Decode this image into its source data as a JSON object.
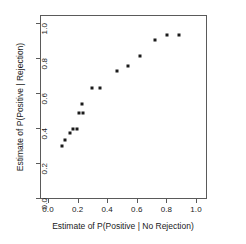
{
  "chart_data": {
    "type": "scatter",
    "title": "",
    "xlabel": "Estimate of P(Positive | No Rejection)",
    "ylabel": "Estimate of P(Positive | Rejection)",
    "xlim": [
      0.0,
      1.0
    ],
    "ylim": [
      0.0,
      1.0
    ],
    "xticks": [
      "0.0",
      "0.2",
      "0.4",
      "0.6",
      "0.8",
      "1.0"
    ],
    "xtick_values": [
      0.0,
      0.2,
      0.4,
      0.6,
      0.8,
      1.0
    ],
    "yticks": [
      "0.0",
      "0.2",
      "0.4",
      "0.6",
      "0.8",
      "1.0"
    ],
    "ytick_values": [
      0.0,
      0.2,
      0.4,
      0.6,
      0.8,
      1.0
    ],
    "grid": false,
    "legend": null,
    "marker": "filled-square",
    "marker_color": "#1b1b1b",
    "points": [
      {
        "x": 0.09,
        "y": 0.305
      },
      {
        "x": 0.105,
        "y": 0.335
      },
      {
        "x": 0.145,
        "y": 0.375
      },
      {
        "x": 0.165,
        "y": 0.4
      },
      {
        "x": 0.19,
        "y": 0.4
      },
      {
        "x": 0.205,
        "y": 0.49
      },
      {
        "x": 0.23,
        "y": 0.49
      },
      {
        "x": 0.225,
        "y": 0.545
      },
      {
        "x": 0.29,
        "y": 0.635
      },
      {
        "x": 0.345,
        "y": 0.635
      },
      {
        "x": 0.46,
        "y": 0.73
      },
      {
        "x": 0.535,
        "y": 0.76
      },
      {
        "x": 0.615,
        "y": 0.82
      },
      {
        "x": 0.715,
        "y": 0.91
      },
      {
        "x": 0.795,
        "y": 0.94
      },
      {
        "x": 0.875,
        "y": 0.94
      }
    ]
  },
  "colors": {
    "background": "#ffffff",
    "axis": "#5a5a5a",
    "marker": "#1b1b1b",
    "text": "#1a1a1a"
  }
}
